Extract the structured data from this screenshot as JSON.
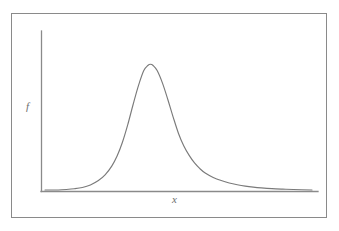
{
  "figure": {
    "background_color": "#ffffff",
    "frame_color": "#8a8a8a",
    "axis_color": "#8a8a8a",
    "curve_color": "#7a7a7a"
  },
  "axes": {
    "y_label": "f",
    "x_label": "x",
    "origin": {
      "x": 41,
      "y": 191
    },
    "y_axis_top": 31,
    "x_axis_right": 318,
    "ticks_shown": false,
    "tick_labels": []
  },
  "chart_data": {
    "type": "line",
    "title": "",
    "subtitle": "",
    "xlabel": "x",
    "ylabel": "f",
    "grid": false,
    "legend": false,
    "legend_position": "none",
    "axis_ticks": false,
    "annotations": [],
    "series": [
      {
        "name": "probability density",
        "shape": "unimodal right-skewed density",
        "peak_x": 0.395,
        "peak_y": 1.0,
        "x": [
          0.0,
          0.02,
          0.05,
          0.08,
          0.11,
          0.14,
          0.17,
          0.2,
          0.225,
          0.25,
          0.27,
          0.29,
          0.31,
          0.33,
          0.35,
          0.37,
          0.385,
          0.395,
          0.405,
          0.42,
          0.44,
          0.46,
          0.48,
          0.5,
          0.52,
          0.54,
          0.56,
          0.58,
          0.6,
          0.63,
          0.66,
          0.69,
          0.72,
          0.75,
          0.78,
          0.81,
          0.85,
          0.89,
          0.93,
          1.0
        ],
        "values": [
          0.0,
          0.0,
          0.0,
          0.004,
          0.01,
          0.02,
          0.04,
          0.075,
          0.12,
          0.19,
          0.27,
          0.38,
          0.52,
          0.68,
          0.83,
          0.95,
          0.99,
          1.0,
          0.99,
          0.95,
          0.85,
          0.72,
          0.58,
          0.45,
          0.35,
          0.275,
          0.215,
          0.17,
          0.135,
          0.1,
          0.075,
          0.056,
          0.042,
          0.031,
          0.023,
          0.017,
          0.011,
          0.007,
          0.004,
          0.0
        ]
      }
    ],
    "xlim": [
      0,
      1
    ],
    "ylim": [
      0,
      1.05
    ]
  }
}
